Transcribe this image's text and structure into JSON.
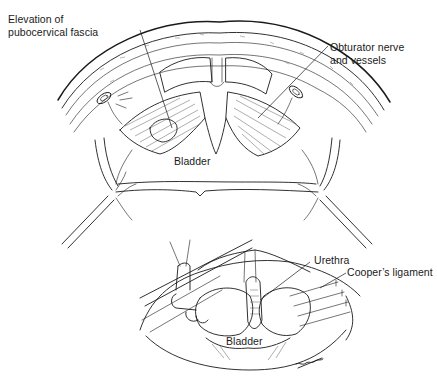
{
  "figure_top": {
    "labels": {
      "pubocervical_line1": "Elevation of",
      "pubocervical_line2": "pubocervical fascia",
      "obturator_line1": "Obturator nerve",
      "obturator_line2": "and vessels",
      "bladder": "Bladder"
    }
  },
  "figure_bottom": {
    "labels": {
      "urethra": "Urethra",
      "coopers": "Cooper’s ligament",
      "bladder": "Bladder"
    }
  },
  "colors": {
    "ink": "#1a1a1a",
    "background": "#ffffff"
  }
}
